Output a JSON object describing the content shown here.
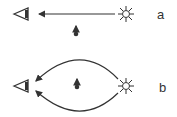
{
  "panels": [
    {
      "label": "a",
      "description": "direct light path from star to eye with object below path"
    },
    {
      "label": "b",
      "description": "two curved light paths around object from star to eye"
    }
  ],
  "icons": {
    "observer": "eye-icon",
    "source": "star-icon",
    "object": "object-arrow-icon"
  },
  "colors": {
    "stroke": "#333333"
  }
}
